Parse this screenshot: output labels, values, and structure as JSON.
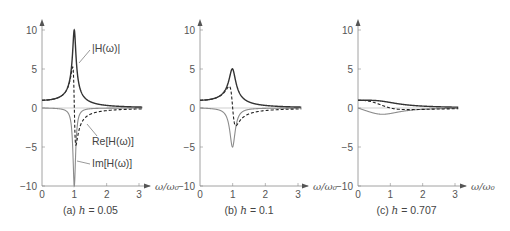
{
  "chart_data": [
    {
      "type": "line",
      "panel": "a",
      "caption_prefix": "(a)",
      "caption_var": "h",
      "caption_value": "= 0.05",
      "h": 0.05,
      "title": "(a) h = 0.05",
      "xlabel": "ω/ω₀",
      "ylabel": "",
      "xlim": [
        0,
        3
      ],
      "ylim": [
        -10,
        10
      ],
      "xticks": [
        "0",
        "1",
        "2",
        "3"
      ],
      "yticks": [
        "10",
        "5",
        "0",
        "−5",
        "−10"
      ],
      "grid": false,
      "series": [
        {
          "name": "|H(ω)|",
          "style": "solid-dark",
          "peak": {
            "x": 1.0,
            "y": 10
          }
        },
        {
          "name": "Re[H(ω)]",
          "style": "dashed",
          "max": {
            "x": 0.95,
            "y": 5
          },
          "min": {
            "x": 1.05,
            "y": -5
          }
        },
        {
          "name": "Im[H(ω)]",
          "style": "solid-gray",
          "min": {
            "x": 1.0,
            "y": -10
          }
        }
      ],
      "annotations": [
        {
          "text": "|H(ω)|",
          "target": "|H(ω)|"
        },
        {
          "text": "Re[H(ω)]",
          "target": "Re[H(ω)]"
        },
        {
          "text": "Im[H(ω)]",
          "target": "Im[H(ω)]"
        }
      ]
    },
    {
      "type": "line",
      "panel": "b",
      "caption_prefix": "(b)",
      "caption_var": "h",
      "caption_value": "= 0.1",
      "h": 0.1,
      "title": "(b) h = 0.1",
      "xlabel": "ω/ω₀",
      "xlim": [
        0,
        3
      ],
      "ylim": [
        -10,
        10
      ],
      "xticks": [
        "0",
        "1",
        "2",
        "3"
      ],
      "yticks": [
        "10",
        "5",
        "0",
        "−5",
        "−10"
      ],
      "grid": false,
      "series": [
        {
          "name": "|H(ω)|",
          "style": "solid-dark",
          "peak": {
            "x": 1.0,
            "y": 5
          }
        },
        {
          "name": "Re[H(ω)]",
          "style": "dashed",
          "max": {
            "x": 0.9,
            "y": 2.5
          },
          "min": {
            "x": 1.1,
            "y": -2.5
          }
        },
        {
          "name": "Im[H(ω)]",
          "style": "solid-gray",
          "min": {
            "x": 1.0,
            "y": -5
          }
        }
      ]
    },
    {
      "type": "line",
      "panel": "c",
      "caption_prefix": "(c)",
      "caption_var": "h",
      "caption_value": "= 0.707",
      "h": 0.707,
      "title": "(c) h = 0.707",
      "xlabel": "ω/ω₀",
      "xlim": [
        0,
        3
      ],
      "ylim": [
        -10,
        10
      ],
      "xticks": [
        "0",
        "1",
        "2",
        "3"
      ],
      "yticks": [
        "10",
        "5",
        "0",
        "−5",
        "−10"
      ],
      "grid": false,
      "series": [
        {
          "name": "|H(ω)|",
          "style": "solid-dark",
          "start": {
            "x": 0,
            "y": 1.0
          }
        },
        {
          "name": "Re[H(ω)]",
          "style": "dashed",
          "start": {
            "x": 0,
            "y": 1.0
          }
        },
        {
          "name": "Im[H(ω)]",
          "style": "solid-gray",
          "min": {
            "x": 0.8,
            "y": -0.7
          }
        }
      ]
    }
  ],
  "layout": {
    "panels": [
      {
        "x0": 42,
        "x1": 139,
        "yTop": 30,
        "y0": 108,
        "yBot": 186,
        "arrowEnd": 150
      },
      {
        "x0": 200,
        "x1": 298,
        "yTop": 30,
        "y0": 108,
        "yBot": 186,
        "arrowEnd": 308
      },
      {
        "x0": 358,
        "x1": 455,
        "yTop": 30,
        "y0": 108,
        "yBot": 186,
        "arrowEnd": 466
      }
    ],
    "colors": {
      "axis": "#8a8a8a",
      "magnitude": "#333333",
      "real": "#222222",
      "imag": "#8c8c8c",
      "text": "#555555"
    }
  }
}
